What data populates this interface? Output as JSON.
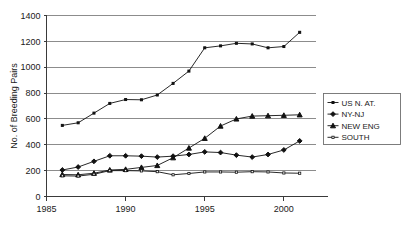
{
  "chart_data": {
    "type": "line",
    "title": "",
    "xlabel": "",
    "ylabel": "No. of Breeding Pairs",
    "xlim": [
      1985,
      2002
    ],
    "ylim": [
      0,
      1400
    ],
    "ytick_values": [
      0,
      200,
      400,
      600,
      800,
      1000,
      1200,
      1400
    ],
    "ytick_labels": [
      "0",
      "200",
      "400",
      "600",
      "800",
      "1000",
      "1200",
      "1400"
    ],
    "xtick_values": [
      1985,
      1990,
      1995,
      2000
    ],
    "xtick_labels": [
      "1985",
      "1990",
      "1995",
      "2000"
    ],
    "grid": "horizontal",
    "legend_position": "right",
    "x": [
      1986,
      1987,
      1988,
      1989,
      1990,
      1991,
      1992,
      1993,
      1994,
      1995,
      1996,
      1997,
      1998,
      1999,
      2000,
      2001
    ],
    "series": [
      {
        "name": "US N. AT.",
        "marker": "small-square",
        "values": [
          550,
          570,
          645,
          720,
          750,
          748,
          785,
          875,
          970,
          1150,
          1165,
          1185,
          1180,
          1150,
          1160,
          1270
        ]
      },
      {
        "name": "NY-NJ",
        "marker": "diamond",
        "values": [
          205,
          228,
          272,
          315,
          315,
          312,
          305,
          312,
          325,
          345,
          340,
          320,
          305,
          325,
          360,
          430
        ]
      },
      {
        "name": "NEW ENG",
        "marker": "triangle",
        "values": [
          170,
          168,
          180,
          205,
          210,
          225,
          240,
          300,
          375,
          450,
          545,
          600,
          622,
          625,
          628,
          632
        ]
      },
      {
        "name": "SOUTH",
        "marker": "open-square",
        "values": [
          160,
          158,
          172,
          200,
          200,
          198,
          192,
          168,
          178,
          190,
          190,
          188,
          192,
          190,
          182,
          180
        ]
      }
    ]
  },
  "legend": {
    "items": [
      {
        "label": "US N. AT."
      },
      {
        "label": "NY-NJ"
      },
      {
        "label": "NEW ENG"
      },
      {
        "label": "SOUTH"
      }
    ]
  },
  "colors": {
    "line": "#111111",
    "gridline": "#8c8c8c",
    "axis": "#3a3a3a",
    "background": "#ffffff"
  }
}
